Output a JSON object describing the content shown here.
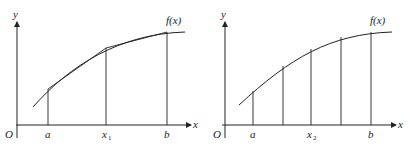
{
  "figures": [
    {
      "id": "left",
      "description": "Curve f(x) over [a,b] approximated by two chords (trapezoids) with midpoint x1",
      "axis_labels": {
        "y": "y",
        "x": "x",
        "origin": "O"
      },
      "curve_label": "f(x)",
      "tick_labels": [
        {
          "main": "a",
          "sub": ""
        },
        {
          "main": "x",
          "sub": "1"
        },
        {
          "main": "b",
          "sub": ""
        }
      ],
      "subdivisions": 2
    },
    {
      "id": "right",
      "description": "Curve f(x) over [a,b] with four subintervals; x2 is the midpoint",
      "axis_labels": {
        "y": "y",
        "x": "x",
        "origin": "O"
      },
      "curve_label": "f(x)",
      "tick_labels": [
        {
          "main": "a",
          "sub": ""
        },
        {
          "main": "x",
          "sub": "2"
        },
        {
          "main": "b",
          "sub": ""
        }
      ],
      "subdivisions": 4
    }
  ]
}
